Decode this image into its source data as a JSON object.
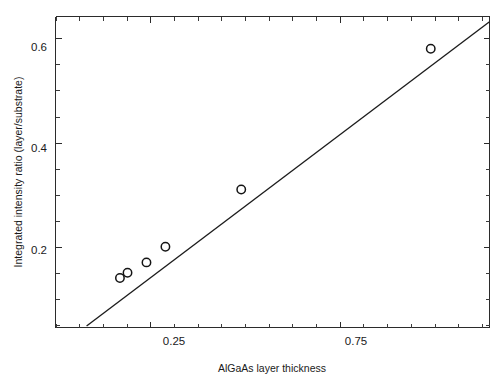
{
  "chart_data": {
    "type": "scatter",
    "title": "",
    "xlabel": "AlGaAs layer thickness",
    "ylabel": "Integrated intensity ratio (layer/substrate)",
    "xlim": [
      0.0,
      1.145
    ],
    "ylim": [
      0.045,
      0.642
    ],
    "grid": false,
    "legend": null,
    "x_major_ticks": [
      0.25,
      0.75
    ],
    "x_major_ticklabels": [
      "0.25",
      "0.75"
    ],
    "x_minor_tick_interval": 0.0625,
    "y_major_ticks": [
      0.2,
      0.4,
      0.6
    ],
    "y_major_ticklabels": [
      "0.2",
      "0.4",
      "0.6"
    ],
    "y_minor_tick_interval": 0.05,
    "series": [
      {
        "name": "measured",
        "marker": "open-circle",
        "x": [
          0.17,
          0.19,
          0.24,
          0.29,
          0.49,
          0.99
        ],
        "y": [
          0.14,
          0.15,
          0.17,
          0.2,
          0.31,
          0.58
        ]
      },
      {
        "name": "linear-fit",
        "type": "line",
        "x_endpoints": [
          0.082,
          1.145
        ],
        "y_endpoints": [
          0.048,
          0.632
        ]
      }
    ]
  },
  "axes": {
    "x_title": "AlGaAs layer thickness",
    "y_title": "Integrated intensity ratio (layer/substrate)",
    "x_label_0": "0.25",
    "x_label_1": "0.75",
    "y_label_0": "0.2",
    "y_label_1": "0.4",
    "y_label_2": "0.6"
  },
  "colors": {
    "axis": "#2b2b2b",
    "line": "#1c1c1c",
    "marker_edge": "#141414",
    "marker_fill": "#ffffff",
    "background": "#ffffff"
  }
}
